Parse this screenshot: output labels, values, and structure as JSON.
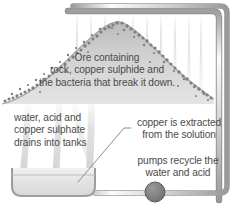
{
  "diagram": {
    "captions": {
      "heap": "Ore containing\nrock, copper sulphide and\nthe bacteria that break it down.",
      "drain": "water, acid and\ncopper sulphate\ndrains into tanks",
      "extract": "copper is extracted\nfrom the solution",
      "pump": "pumps recycle the\nwater and acid"
    },
    "parts": {
      "heap_label": "ore-heap",
      "tank_label": "collection-tank",
      "pump_label": "pump",
      "top_pipe_label": "sprinkler-pipe",
      "right_pipe_label": "return-pipe",
      "spray_label": "acid-spray",
      "drain_label": "drainage-flow",
      "leader_label": "leader-line"
    },
    "colors": {
      "text": "#4b4b4b",
      "heap_fill_light": "#d6d6d6",
      "heap_fill_dark": "#9b9b9b",
      "heap_speckle": "#8a8a8a",
      "pipe_light": "#f1f1f1",
      "pipe_mid": "#c9c9c9",
      "pipe_dark": "#8f8f8f",
      "pump_fill": "#7e7e7e",
      "tank_fill": "#e6e6e6",
      "spray": "#e3e3e3",
      "background": "#ffffff"
    }
  }
}
